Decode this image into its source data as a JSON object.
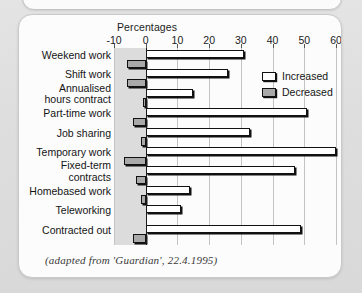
{
  "caption": "(adapted from 'Guardian', 22.4.1995)",
  "legend": {
    "increased_label": "Increased",
    "decreased_label": "Decreased",
    "increased_color": "#ffffff",
    "decreased_color": "#a9a9a9"
  },
  "chart_data": {
    "type": "bar",
    "orientation": "horizontal",
    "title": "Percentages",
    "xlabel": "Percentages",
    "ylabel": "",
    "xlim": [
      -10,
      60
    ],
    "xticks": [
      -10,
      0,
      10,
      20,
      30,
      40,
      50,
      60
    ],
    "xticklabels": [
      "-10",
      "0",
      "10",
      "20",
      "30",
      "40",
      "50",
      "60"
    ],
    "grid": true,
    "legend_position": "upper right",
    "categories": [
      "Weekend work",
      "Shift work",
      "Annualised\nhours contract",
      "Part-time work",
      "Job sharing",
      "Temporary work",
      "Fixed-term\ncontracts",
      "Homebased work",
      "Teleworking",
      "Contracted out"
    ],
    "series": [
      {
        "name": "Increased",
        "color": "#ffffff",
        "values": [
          31,
          26,
          15,
          51,
          33,
          60,
          47,
          14,
          11,
          49
        ]
      },
      {
        "name": "Decreased",
        "color": "#a9a9a9",
        "values": [
          -6,
          -6,
          -1,
          -4,
          -1.5,
          -7,
          -3,
          -1.5,
          0,
          -4
        ]
      }
    ]
  }
}
